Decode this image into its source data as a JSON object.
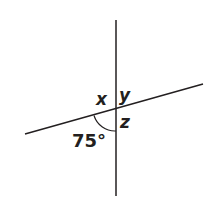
{
  "diagram": {
    "labels": {
      "x": "x",
      "y": "y",
      "z": "z",
      "given_angle": "75°"
    },
    "given_angle_value": 75,
    "unknown_angles": [
      "x",
      "y",
      "z"
    ],
    "colors": {
      "line": "#231f20",
      "background": "#ffffff"
    }
  }
}
